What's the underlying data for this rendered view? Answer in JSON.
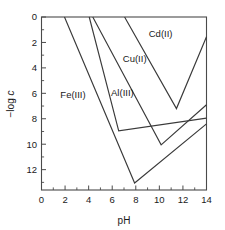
{
  "chart_data": {
    "type": "line",
    "title": "",
    "xlabel": "pH",
    "ylabel": "−log c",
    "xlim": [
      0,
      14
    ],
    "ylim_inverted": [
      0,
      13.6
    ],
    "grid": false,
    "legend_position": "inline-labels",
    "x_ticks": [
      0,
      2,
      4,
      6,
      8,
      10,
      12,
      14
    ],
    "x_ticklabels": [
      "0",
      "2",
      "4",
      "6",
      "8",
      "10",
      "12",
      "14"
    ],
    "x_minor_ticks": [
      1,
      3,
      5,
      7,
      9,
      11,
      13
    ],
    "y_ticks": [
      0,
      2,
      4,
      6,
      8,
      10,
      12
    ],
    "y_ticklabels": [
      "0",
      "2",
      "4",
      "6",
      "8",
      "10",
      "12"
    ],
    "y_minor_ticks": [
      1,
      3,
      5,
      7,
      9,
      11,
      13
    ],
    "series": [
      {
        "name": "Fe(III)",
        "label": "Fe(III)",
        "label_pH": 1.6,
        "label_logc": 6.4,
        "points": [
          [
            1.95,
            0.0
          ],
          [
            7.9,
            13.05
          ],
          [
            14.0,
            8.4
          ]
        ]
      },
      {
        "name": "Al(III)",
        "label": "Al(III)",
        "label_pH": 5.9,
        "label_logc": 6.2,
        "points": [
          [
            4.05,
            0.0
          ],
          [
            6.55,
            8.95
          ],
          [
            14.0,
            7.95
          ]
        ]
      },
      {
        "name": "Cu(II)",
        "label": "Cu(II)",
        "label_pH": 6.9,
        "label_logc": 3.5,
        "points": [
          [
            4.35,
            0.0
          ],
          [
            10.15,
            10.05
          ],
          [
            14.0,
            6.9
          ]
        ]
      },
      {
        "name": "Cd(II)",
        "label": "Cd(II)",
        "label_pH": 9.1,
        "label_logc": 1.6,
        "points": [
          [
            7.05,
            0.0
          ],
          [
            11.45,
            7.2
          ],
          [
            14.0,
            1.55
          ]
        ]
      }
    ]
  },
  "axes": {
    "x_title": "pH",
    "y_title_prefix": "−log ",
    "y_title_italic": "c"
  },
  "colors": {
    "curve": "#3a3a3a",
    "axis": "#4a4a4a",
    "text": "#1a1a1a",
    "background": "#ffffff"
  }
}
